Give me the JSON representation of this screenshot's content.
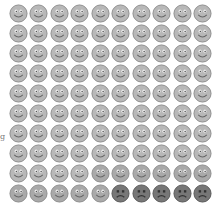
{
  "chart_data": {
    "type": "pictograph",
    "title": "",
    "rows": 10,
    "cols": 10,
    "total": 100,
    "categories": [
      "happy",
      "neutral",
      "sad"
    ],
    "values": [
      84,
      11,
      5
    ],
    "fill_order": "row-major",
    "colors": {
      "happy": "#b8b8b8",
      "neutral": "#a9a9a9",
      "sad": "#777777"
    }
  },
  "side_label": "g"
}
